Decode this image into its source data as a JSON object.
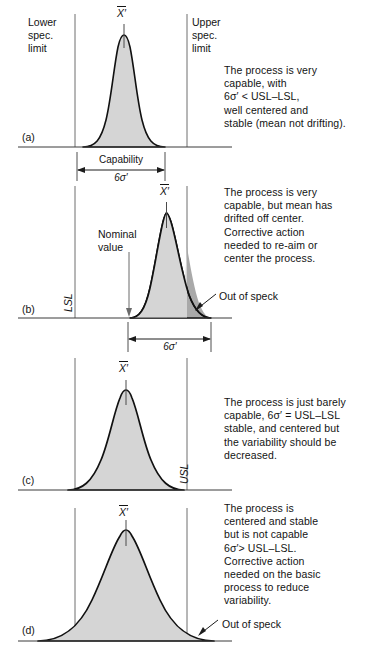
{
  "figure": {
    "colors": {
      "curve_stroke": "#111111",
      "fill_in_spec": "#d5d5d5",
      "fill_out_of_spec": "#a9a9a9",
      "axis": "#3a3a3a",
      "spec_line": "#6e6e6e",
      "text": "#131313"
    },
    "symbols": {
      "mean_label": "X′",
      "sigma_label": "6σ′"
    }
  },
  "panels": [
    {
      "letter": "(a)",
      "mean_label": "X′",
      "lower_spec_text": "Lower\nspec.\nlimit",
      "upper_spec_text": "Upper\nspec.\nlimit",
      "dimension_label": "Capability",
      "dimension_value": "6σ′",
      "caption": "The process is very\ncapable, with\n6σ′ < USL–LSL,\nwell centered and\nstable (mean not drifting).",
      "caption_lines": [
        "The process is very",
        "capable, with",
        "6σ′ < USL–LSL,",
        "well centered and",
        "stable (mean not drifting)."
      ]
    },
    {
      "letter": "(b)",
      "mean_label": "X′",
      "lsl_label": "LSL",
      "nominal_label": "Nominal\nvalue",
      "dimension_value": "6σ′",
      "out_of_spec_label": "Out of speck",
      "caption": "The process is very\ncapable, but mean has\ndrifted off center.\nCorrective action\nneeded to re-aim or\ncenter the process.",
      "caption_lines": [
        "The process is very",
        "capable, but mean has",
        "drifted off center.",
        "Corrective action",
        "needed to re-aim or",
        "center the process."
      ]
    },
    {
      "letter": "(c)",
      "mean_label": "X′",
      "usl_label": "USL",
      "caption": "The process is just barely\ncapable, 6σ′ = USL–LSL\nstable, and centered but\nthe variability should be\ndecreased.",
      "caption_lines": [
        "The process is just barely",
        "capable, 6σ′ = USL–LSL",
        "stable, and centered but",
        "the variability should be",
        "decreased."
      ]
    },
    {
      "letter": "(d)",
      "mean_label": "X′",
      "out_of_spec_label": "Out of speck",
      "caption": "The process is\ncentered and stable\nbut is not capable\n6σ′> USL–LSL.\nCorrective action\nneeded on the basic\nprocess to reduce\nvariability.",
      "caption_lines": [
        "The process is",
        "centered and stable",
        "but is not capable",
        "6σ′> USL–LSL.",
        "Corrective action",
        "needed on the basic",
        "process to reduce",
        "variability."
      ]
    }
  ]
}
